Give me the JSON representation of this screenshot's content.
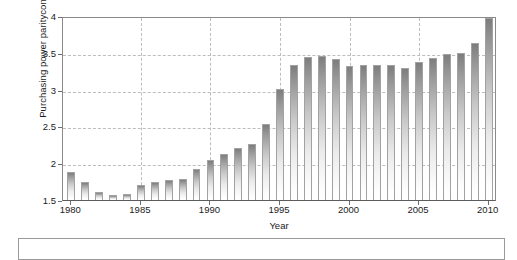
{
  "chart_data": {
    "type": "bar",
    "title": "",
    "xlabel": "Year",
    "ylabel": "Purchasing power parity conversion rates",
    "ylabel_line1": "Purchasing power parity",
    "ylabel_line2": "conversion rates",
    "ylim": [
      1.5,
      4.0
    ],
    "xlim": [
      1979.4,
      2010.6
    ],
    "grid": "dashed gridlines on both axes",
    "legend": "none",
    "bar_color_top": "#7d7d7d",
    "bar_color_bottom": "#ffffff",
    "bar_outline": "#a2a2a2",
    "axis_color": "#6d6d6d",
    "grid_color": "#bdbdbd",
    "ytick_labels": [
      "1.5",
      "2",
      "2.5",
      "3",
      "3.5",
      "4"
    ],
    "ytick_values": [
      1.5,
      2,
      2.5,
      3,
      3.5,
      4
    ],
    "xtick_labels": [
      "1980",
      "1985",
      "1990",
      "1995",
      "2000",
      "2005",
      "2010"
    ],
    "xtick_values": [
      1980,
      1985,
      1990,
      1995,
      2000,
      2005,
      2010
    ],
    "categories": [
      "1980",
      "1981",
      "1982",
      "1983",
      "1984",
      "1985",
      "1986",
      "1987",
      "1988",
      "1989",
      "1990",
      "1991",
      "1992",
      "1993",
      "1994",
      "1995",
      "1996",
      "1997",
      "1998",
      "1999",
      "2000",
      "2001",
      "2002",
      "2003",
      "2004",
      "2005",
      "2006",
      "2007",
      "2008",
      "2009",
      "2010"
    ],
    "values": [
      1.88,
      1.74,
      1.61,
      1.57,
      1.58,
      1.7,
      1.74,
      1.77,
      1.79,
      1.92,
      2.05,
      2.12,
      2.2,
      2.26,
      2.53,
      3.01,
      3.33,
      3.44,
      3.46,
      3.42,
      3.32,
      3.33,
      3.34,
      3.34,
      3.29,
      3.37,
      3.43,
      3.48,
      3.5,
      3.63,
      3.97
    ]
  }
}
